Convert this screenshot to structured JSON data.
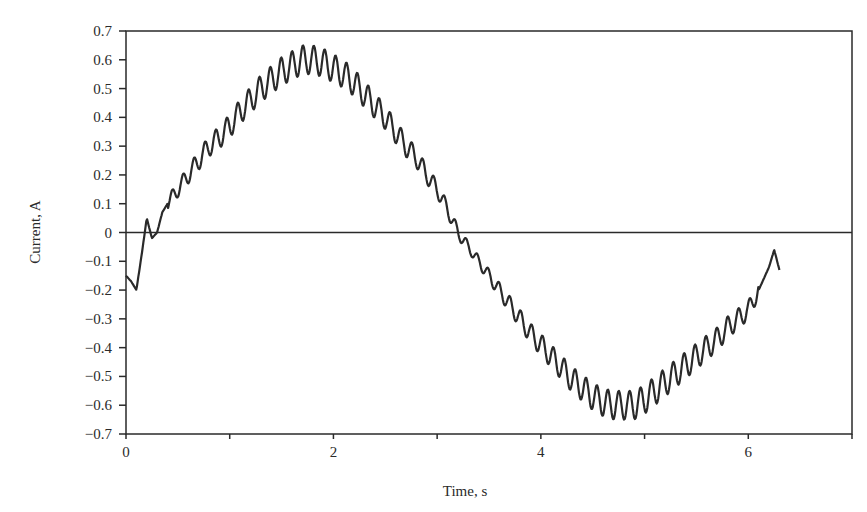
{
  "chart_data": {
    "type": "line",
    "title": "",
    "xlabel": "Time, s",
    "ylabel": "Current, A",
    "xlim": [
      0,
      7
    ],
    "ylim": [
      -0.7,
      0.7
    ],
    "x_ticks": [
      0,
      1,
      2,
      3,
      4,
      5,
      6,
      7
    ],
    "x_tick_labels": [
      "0",
      "",
      "2",
      "",
      "4",
      "",
      "6",
      ""
    ],
    "y_ticks": [
      0.7,
      0.6,
      0.5,
      0.4,
      0.3,
      0.2,
      0.1,
      0,
      -0.1,
      -0.2,
      -0.3,
      -0.4,
      -0.5,
      -0.6,
      -0.7
    ],
    "y_tick_labels": [
      "0.7",
      "0.6",
      "0.5",
      "0.4",
      "0.3",
      "0.2",
      "0.1",
      "0",
      "−0.1",
      "−0.2",
      "−0.3",
      "−0.4",
      "−0.5",
      "−0.6",
      "−0.7"
    ],
    "grid": false,
    "zero_line": true,
    "legend": null,
    "line_color": "#2a2a2a",
    "series": [
      {
        "name": "Current",
        "description": "Noisy sinusoid with high-frequency ripple, approx 0.6*sin(t-0.25)",
        "x": [
          0.0,
          0.05,
          0.1,
          0.15,
          0.2,
          0.25,
          0.3,
          0.35,
          0.4,
          0.5,
          0.6,
          0.7,
          0.8,
          0.9,
          1.0,
          1.1,
          1.2,
          1.3,
          1.4,
          1.5,
          1.6,
          1.7,
          1.8,
          1.9,
          2.0,
          2.1,
          2.2,
          2.3,
          2.4,
          2.5,
          2.6,
          2.7,
          2.8,
          2.9,
          3.0,
          3.1,
          3.2,
          3.3,
          3.4,
          3.5,
          3.6,
          3.7,
          3.8,
          3.9,
          4.0,
          4.1,
          4.2,
          4.3,
          4.4,
          4.5,
          4.6,
          4.7,
          4.8,
          4.9,
          5.0,
          5.1,
          5.2,
          5.3,
          5.4,
          5.5,
          5.6,
          5.7,
          5.8,
          5.9,
          6.0,
          6.1,
          6.2,
          6.25,
          6.3
        ],
        "y": [
          -0.15,
          -0.17,
          -0.2,
          -0.08,
          0.05,
          -0.02,
          0.0,
          0.07,
          0.1,
          0.15,
          0.2,
          0.25,
          0.3,
          0.33,
          0.37,
          0.42,
          0.46,
          0.5,
          0.53,
          0.56,
          0.58,
          0.6,
          0.6,
          0.59,
          0.57,
          0.55,
          0.52,
          0.48,
          0.44,
          0.4,
          0.35,
          0.3,
          0.26,
          0.2,
          0.15,
          0.08,
          0.0,
          -0.05,
          -0.1,
          -0.15,
          -0.2,
          -0.25,
          -0.3,
          -0.35,
          -0.39,
          -0.43,
          -0.47,
          -0.51,
          -0.54,
          -0.57,
          -0.59,
          -0.6,
          -0.6,
          -0.6,
          -0.58,
          -0.55,
          -0.52,
          -0.49,
          -0.46,
          -0.43,
          -0.4,
          -0.37,
          -0.33,
          -0.3,
          -0.27,
          -0.2,
          -0.12,
          -0.06,
          -0.13
        ],
        "ripple_amplitude": 0.05
      }
    ]
  }
}
